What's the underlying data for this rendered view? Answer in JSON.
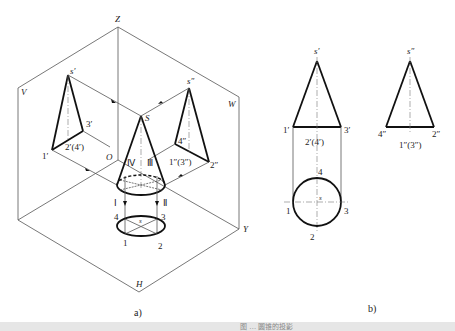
{
  "figure_a": {
    "caption": "a)",
    "planes": {
      "V": "V",
      "W": "W",
      "H": "H"
    },
    "axes": {
      "Z": "Z",
      "Y": "Y",
      "O": "O"
    },
    "apex": "S",
    "v_proj": {
      "apex": "s′",
      "p1": "1′",
      "p3": "3′",
      "p24": "2′(4′)"
    },
    "w_proj": {
      "apex": "s″",
      "p4": "4″",
      "p2": "2″",
      "p13": "1″(3″)"
    },
    "cone_points": {
      "I": "Ⅰ",
      "II": "Ⅱ",
      "III": "Ⅲ",
      "IV": "Ⅳ"
    },
    "h_proj": {
      "center": "s",
      "p1": "1",
      "p2": "2",
      "p3": "3",
      "p4": "4"
    }
  },
  "figure_b": {
    "caption": "b)",
    "front": {
      "apex": "s′",
      "left": "1′",
      "right": "3′",
      "mid": "2′(4′)"
    },
    "side": {
      "apex": "s″",
      "left": "4″",
      "right": "2″",
      "mid": "1″(3″)"
    },
    "top": {
      "center": "s",
      "p1": "1",
      "p2": "2",
      "p3": "3",
      "p4": "4"
    }
  },
  "footer": {
    "caption": "图 … 圆锥的投影"
  }
}
